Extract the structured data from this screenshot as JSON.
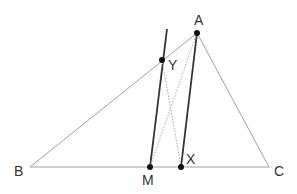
{
  "diagram": {
    "type": "geometry",
    "points": {
      "A": {
        "label": "A",
        "x": 197,
        "y": 33,
        "label_x": 194,
        "label_y": 25
      },
      "B": {
        "label": "B",
        "x": 30,
        "y": 167,
        "label_x": 14,
        "label_y": 176
      },
      "C": {
        "label": "C",
        "x": 269,
        "y": 167,
        "label_x": 274,
        "label_y": 176
      },
      "M": {
        "label": "M",
        "x": 150,
        "y": 167,
        "label_x": 142,
        "label_y": 185
      },
      "X": {
        "label": "X",
        "x": 181,
        "y": 167,
        "label_x": 186,
        "label_y": 164
      },
      "Y": {
        "label": "Y",
        "x": 162,
        "y": 60,
        "label_x": 168,
        "label_y": 70
      }
    },
    "segments": [
      {
        "from": "B",
        "to": "C",
        "style": "thin"
      },
      {
        "from": "A",
        "to": "B",
        "style": "thin"
      },
      {
        "from": "A",
        "to": "C",
        "style": "thin"
      },
      {
        "from": "M",
        "to": "Y",
        "style": "bold",
        "extend_to": {
          "x": 167,
          "y": 29
        }
      },
      {
        "from": "X",
        "to": "A",
        "style": "bold"
      },
      {
        "from": "A",
        "to": "M",
        "style": "dotted"
      },
      {
        "from": "Y",
        "to": "X",
        "style": "dotted"
      }
    ],
    "colors": {
      "thin": "#a0a0a0",
      "bold": "#333333",
      "dotted": "#aaaaaa",
      "point": "#111111",
      "label": "#333333"
    }
  }
}
